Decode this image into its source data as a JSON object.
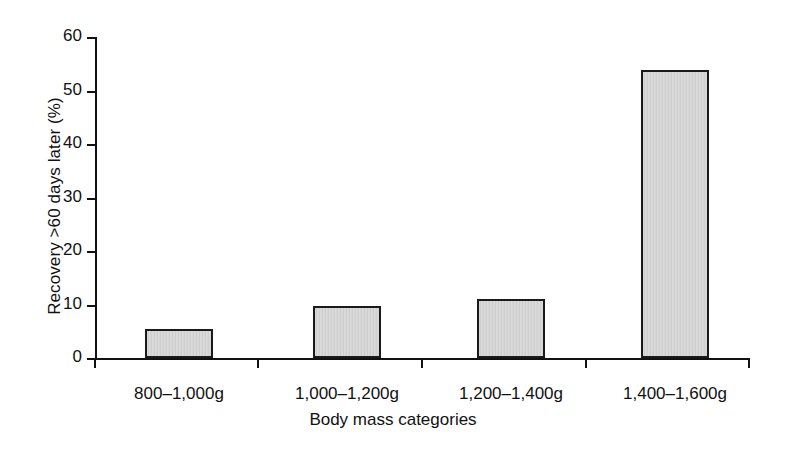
{
  "chart_data": {
    "type": "bar",
    "title": "",
    "subtitle": "",
    "xlabel": "Body mass categories",
    "ylabel": "Recovery >60 days later (%)",
    "categories": [
      "800–1,000g",
      "1,000–1,200g",
      "1,200–1,400g",
      "1,400–1,600g"
    ],
    "values": [
      5.4,
      9.7,
      11.0,
      53.8
    ],
    "ylim": [
      0,
      60
    ],
    "ytick_labels": [
      "0",
      "10",
      "20",
      "30",
      "40",
      "50",
      "60"
    ],
    "ytick_values": [
      0,
      10,
      20,
      30,
      40,
      50,
      60
    ],
    "ytick_step": 10,
    "grid": false,
    "legend": false,
    "legend_position": "none",
    "series": [
      {
        "name": "Recovery >60 days later (%)",
        "values": [
          5.4,
          9.7,
          11.0,
          53.8
        ]
      }
    ],
    "colors": {
      "bar_fill": "#d6d6d6",
      "bar_edge": "#1a1a1a",
      "axis": "#111111",
      "background": "#ffffff",
      "text": "#111111"
    }
  }
}
